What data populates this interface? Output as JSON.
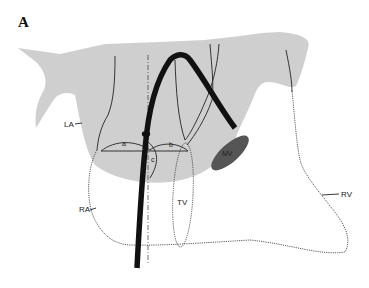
{
  "figure": {
    "panel_label": "A",
    "labels": {
      "la": "LA",
      "ra": "RA",
      "rv": "RV",
      "tv": "TV",
      "mv": "MV",
      "a": "a",
      "b": "b",
      "c": "c"
    },
    "colors": {
      "left_heart_shade": "#cfcfcf",
      "catheter": "#111111",
      "mitral_valve": "#555555",
      "outline": "#222222",
      "background": "#ffffff"
    }
  }
}
